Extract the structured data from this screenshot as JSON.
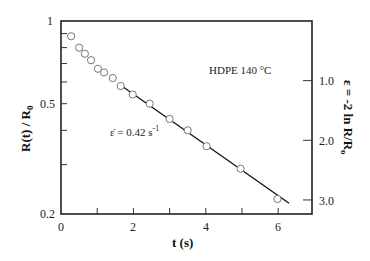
{
  "chart_data": {
    "type": "scatter",
    "title": "",
    "annotation_material": "HDPE 140 °C",
    "annotation_rate": "ε̇ = 0.42 s",
    "annotation_rate_exp": "-1",
    "xlabel": "t (s)",
    "ylabel_left": "R(t) / R",
    "ylabel_left_sub": "0",
    "ylabel_right": "ε = -2 ln R/R",
    "ylabel_right_sub": "o",
    "xlim": [
      0,
      7
    ],
    "ylim_left": [
      0.2,
      1
    ],
    "yscale_left": "log",
    "x_ticks": [
      "0",
      "2",
      "4",
      "6"
    ],
    "y_left_ticks": [
      "1",
      "0.5",
      "0.2"
    ],
    "y_right_ticks": [
      "1.0",
      "2.0",
      "3.0"
    ],
    "grid": false,
    "series": [
      {
        "name": "data",
        "marker": "open-circle",
        "x": [
          0.28,
          0.5,
          0.66,
          0.83,
          1.02,
          1.19,
          1.43,
          1.65,
          1.98,
          2.45,
          3.0,
          3.5,
          4.02,
          4.96,
          5.98
        ],
        "y": [
          0.88,
          0.8,
          0.76,
          0.72,
          0.67,
          0.65,
          0.62,
          0.58,
          0.54,
          0.5,
          0.44,
          0.4,
          0.35,
          0.29,
          0.225
        ]
      },
      {
        "name": "fit",
        "style": "line",
        "x": [
          1.6,
          6.3
        ],
        "y": [
          0.59,
          0.217
        ]
      }
    ]
  }
}
